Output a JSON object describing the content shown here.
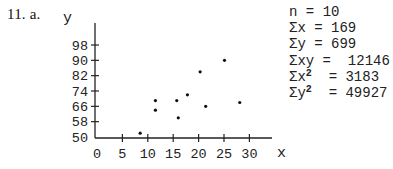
{
  "problem": {
    "label": "11. a."
  },
  "chart_data": {
    "type": "scatter",
    "title": "",
    "xlabel": "x",
    "ylabel": "y",
    "xlim": [
      0,
      33
    ],
    "ylim": [
      50,
      102
    ],
    "x_ticks": [
      0,
      5,
      10,
      15,
      20,
      25,
      30
    ],
    "y_ticks": [
      50,
      58,
      66,
      74,
      82,
      90,
      98
    ],
    "grid": false,
    "points": [
      {
        "x": 8.5,
        "y": 52
      },
      {
        "x": 11.5,
        "y": 69
      },
      {
        "x": 11.5,
        "y": 64
      },
      {
        "x": 15.7,
        "y": 69
      },
      {
        "x": 16.0,
        "y": 60
      },
      {
        "x": 17.8,
        "y": 72
      },
      {
        "x": 20.3,
        "y": 84
      },
      {
        "x": 21.4,
        "y": 66
      },
      {
        "x": 25.1,
        "y": 90
      },
      {
        "x": 28.1,
        "y": 68
      }
    ]
  },
  "stats": [
    {
      "lhs": "n",
      "sup": "",
      "rhs": "10"
    },
    {
      "lhs": "Σx",
      "sup": "",
      "rhs": "169"
    },
    {
      "lhs": "Σy",
      "sup": "",
      "rhs": "699"
    },
    {
      "lhs": "Σxy",
      "sup": "",
      "rhs": "12146"
    },
    {
      "lhs": "Σx",
      "sup": "2",
      "rhs": "3183"
    },
    {
      "lhs": "Σy",
      "sup": "2",
      "rhs": "49927"
    }
  ]
}
